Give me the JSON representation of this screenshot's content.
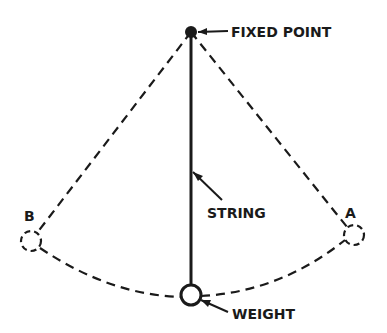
{
  "diagram": {
    "type": "pendulum",
    "labels": {
      "fixed_point": "FIXED POINT",
      "string": "STRING",
      "weight": "WEIGHT",
      "position_a": "A",
      "position_b": "B"
    },
    "colors": {
      "ink": "#1a1a1a",
      "background": "#ffffff"
    }
  }
}
